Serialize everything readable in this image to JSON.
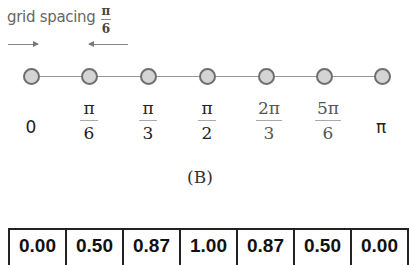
{
  "header": {
    "label": "grid spacing",
    "spacing": {
      "numerator": "π",
      "denominator": "6"
    }
  },
  "arrows": [
    {
      "direction": "right"
    },
    {
      "direction": "left"
    }
  ],
  "grid": {
    "points": [
      {
        "type": "plain",
        "text": "0"
      },
      {
        "type": "frac",
        "numerator": "π",
        "denominator": "6"
      },
      {
        "type": "frac",
        "numerator": "π",
        "denominator": "3"
      },
      {
        "type": "frac",
        "numerator": "π",
        "denominator": "2"
      },
      {
        "type": "frac",
        "numerator": "2π",
        "denominator": "3"
      },
      {
        "type": "frac",
        "numerator": "5π",
        "denominator": "6"
      },
      {
        "type": "plain",
        "text": "π"
      }
    ]
  },
  "caption": "(B)",
  "table": {
    "values": [
      "0.00",
      "0.50",
      "0.87",
      "1.00",
      "0.87",
      "0.50",
      "0.00"
    ]
  }
}
